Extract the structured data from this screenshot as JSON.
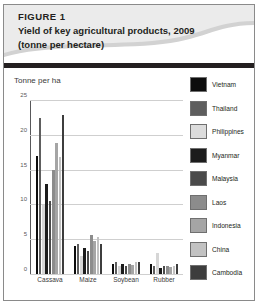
{
  "figure": {
    "label": "FIGURE 1",
    "title": "Yield of key agricultural products, 2009",
    "subtitle": "(tonne per hectare)"
  },
  "colors": {
    "banner_light": "#e8e8e8",
    "banner_shade": "#d2d2d2",
    "rule": "#231f20",
    "frame_border": "#8a8a8a",
    "gridline": "#cfcfcf",
    "axis": "#58585a"
  },
  "chart_data": {
    "type": "bar",
    "title": "Yield of key agricultural products, 2009",
    "subtitle": "(tonne per hectare)",
    "xlabel": "",
    "ylabel": "Tonne per ha",
    "ylim": [
      0,
      25
    ],
    "yticks": [
      0,
      5,
      10,
      15,
      20,
      25
    ],
    "ytick_labels": [
      "0",
      "5",
      "10",
      "15",
      "20",
      "25"
    ],
    "grid": true,
    "legend_position": "right",
    "categories": [
      "Cassava",
      "Maize",
      "Soybean",
      "Rubber"
    ],
    "series": [
      {
        "name": "Vietnam",
        "color": "#0d0d0d",
        "values": [
          17.0,
          4.1,
          1.5,
          1.4
        ]
      },
      {
        "name": "Thailand",
        "color": "#5e5e5e",
        "values": [
          22.6,
          4.4,
          1.7,
          1.1
        ]
      },
      {
        "name": "Philippines",
        "color": "#d6d6d6",
        "values": [
          10.0,
          2.6,
          1.1,
          3.1
        ]
      },
      {
        "name": "Myanmar",
        "color": "#1c1c1c",
        "values": [
          13.0,
          3.7,
          1.4,
          0.8
        ]
      },
      {
        "name": "Malaysia",
        "color": "#4a4a4a",
        "values": [
          10.6,
          3.3,
          1.2,
          1.2
        ]
      },
      {
        "name": "Laos",
        "color": "#8c8c8c",
        "values": [
          15.0,
          5.6,
          1.5,
          1.2
        ]
      },
      {
        "name": "Indonesia",
        "color": "#a5a5a5",
        "values": [
          19.0,
          4.8,
          1.3,
          1.0
        ]
      },
      {
        "name": "China",
        "color": "#c2c2c2",
        "values": [
          16.9,
          5.4,
          1.8,
          1.1
        ]
      },
      {
        "name": "Cambodia",
        "color": "#3d3d3d",
        "values": [
          23.0,
          4.3,
          1.8,
          1.5
        ]
      }
    ]
  },
  "legend": {
    "items": [
      {
        "label": "Vietnam",
        "color": "#0d0d0d"
      },
      {
        "label": "Thailand",
        "color": "#5e5e5e"
      },
      {
        "label": "Philippines",
        "color": "#dcdcdc"
      },
      {
        "label": "Myanmar",
        "color": "#1c1c1c"
      },
      {
        "label": "Malaysia",
        "color": "#4a4a4a"
      },
      {
        "label": "Laos",
        "color": "#8c8c8c"
      },
      {
        "label": "Indonesia",
        "color": "#a5a5a5"
      },
      {
        "label": "China",
        "color": "#c2c2c2"
      },
      {
        "label": "Cambodia",
        "color": "#3d3d3d"
      }
    ]
  }
}
